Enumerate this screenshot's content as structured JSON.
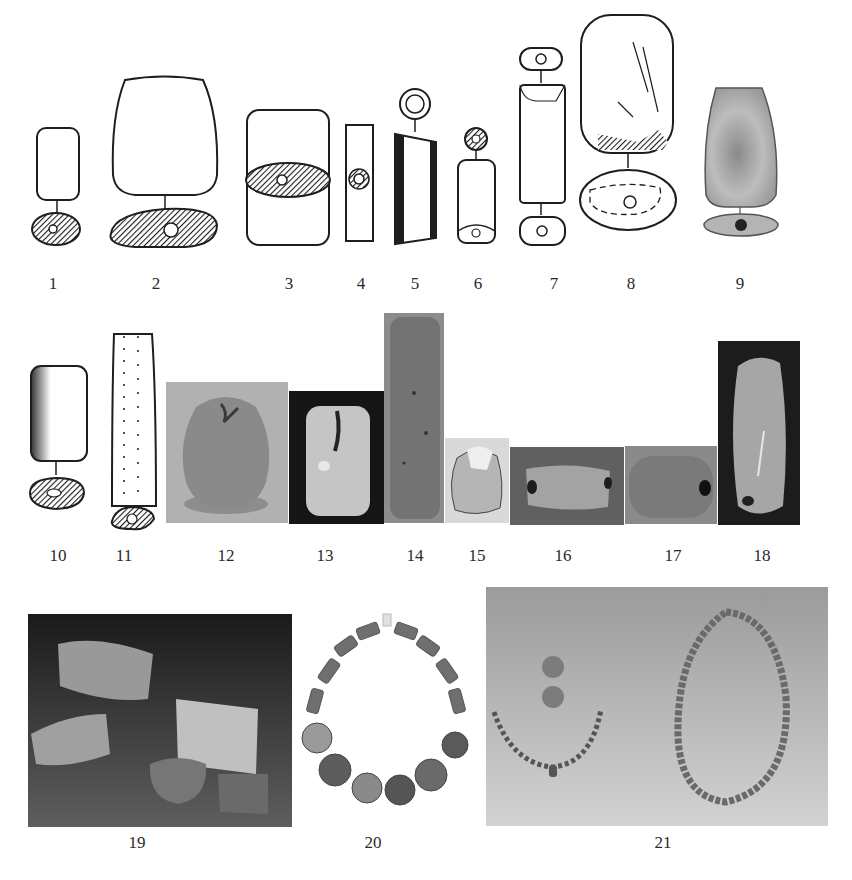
{
  "figure": {
    "items": [
      {
        "number": "1",
        "kind": "drawing"
      },
      {
        "number": "2",
        "kind": "drawing"
      },
      {
        "number": "3",
        "kind": "drawing"
      },
      {
        "number": "4",
        "kind": "drawing"
      },
      {
        "number": "5",
        "kind": "drawing"
      },
      {
        "number": "6",
        "kind": "drawing"
      },
      {
        "number": "7",
        "kind": "drawing"
      },
      {
        "number": "8",
        "kind": "drawing"
      },
      {
        "number": "9",
        "kind": "drawing"
      },
      {
        "number": "10",
        "kind": "drawing"
      },
      {
        "number": "11",
        "kind": "drawing"
      },
      {
        "number": "12",
        "kind": "photo"
      },
      {
        "number": "13",
        "kind": "photo"
      },
      {
        "number": "14",
        "kind": "photo"
      },
      {
        "number": "15",
        "kind": "photo"
      },
      {
        "number": "16",
        "kind": "photo"
      },
      {
        "number": "17",
        "kind": "photo"
      },
      {
        "number": "18",
        "kind": "photo"
      },
      {
        "number": "19",
        "kind": "photo"
      },
      {
        "number": "20",
        "kind": "photo"
      },
      {
        "number": "21",
        "kind": "photo"
      }
    ],
    "colors": {
      "ink": "#1e1e1e",
      "paper": "#ffffff",
      "photo_gray_light": "#a8a8a8",
      "photo_gray_mid": "#7d7d7d",
      "photo_dark": "#1d1d1d"
    }
  }
}
